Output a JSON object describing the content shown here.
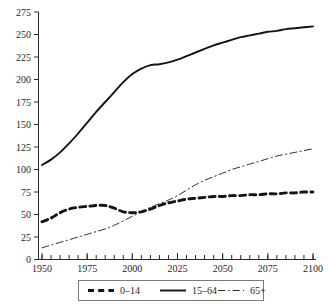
{
  "chart_data": {
    "type": "line",
    "title": "",
    "subtitle": "",
    "xlabel": "",
    "ylabel": "",
    "xlim": [
      1950,
      2100
    ],
    "ylim": [
      0,
      275
    ],
    "grid": false,
    "legend_position": "bottom",
    "x_ticks_major": [
      1950,
      1975,
      2000,
      2025,
      2050,
      2075,
      2100
    ],
    "x_tick_labels": [
      "1950",
      "1975",
      "2000",
      "2025",
      "2050",
      "2075",
      "2100"
    ],
    "x_tick_minor_step": 5,
    "y_ticks": [
      0,
      25,
      50,
      75,
      100,
      125,
      150,
      175,
      200,
      225,
      250,
      275
    ],
    "y_tick_labels": [
      "0",
      "25",
      "50",
      "75",
      "100",
      "125",
      "150",
      "175",
      "200",
      "225",
      "250",
      "275"
    ],
    "x": [
      1950,
      1955,
      1960,
      1965,
      1970,
      1975,
      1980,
      1985,
      1990,
      1995,
      2000,
      2005,
      2010,
      2015,
      2020,
      2025,
      2030,
      2035,
      2040,
      2045,
      2050,
      2055,
      2060,
      2065,
      2070,
      2075,
      2080,
      2085,
      2090,
      2095,
      2100
    ],
    "series": [
      {
        "name": "0–14",
        "style": "dashed",
        "color": "#141414",
        "values": [
          42,
          46,
          52,
          56,
          58,
          59,
          60,
          60,
          57,
          53,
          52,
          53,
          56,
          60,
          63,
          65,
          67,
          68,
          69,
          70,
          70,
          71,
          71,
          72,
          72,
          73,
          73,
          74,
          74,
          75,
          75
        ]
      },
      {
        "name": "15–64",
        "style": "solid",
        "color": "#141414",
        "values": [
          105,
          111,
          119,
          129,
          140,
          152,
          164,
          175,
          186,
          197,
          206,
          212,
          216,
          217,
          219,
          222,
          226,
          230,
          234,
          238,
          241,
          244,
          247,
          249,
          251,
          253,
          254,
          256,
          257,
          258,
          259
        ]
      },
      {
        "name": "65+",
        "style": "dashdot",
        "color": "#2a2a2a",
        "values": [
          13,
          16,
          19,
          22,
          25,
          28,
          31,
          34,
          38,
          43,
          48,
          53,
          58,
          62,
          66,
          71,
          77,
          83,
          88,
          92,
          96,
          100,
          103,
          106,
          109,
          112,
          115,
          117,
          119,
          121,
          123
        ]
      }
    ],
    "legend_entries": [
      {
        "label": "0–14",
        "style": "dashed"
      },
      {
        "label": "15–64",
        "style": "solid"
      },
      {
        "label": "65+",
        "style": "dashdot"
      }
    ]
  }
}
